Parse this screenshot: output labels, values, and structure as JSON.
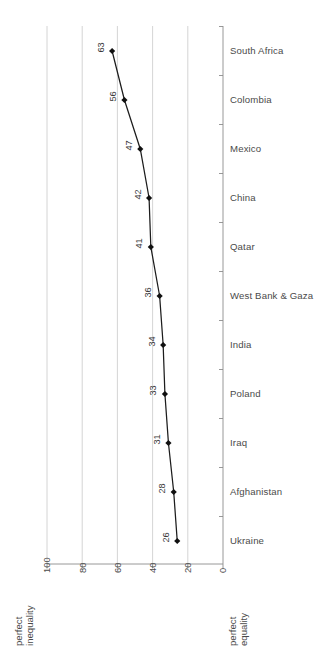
{
  "chart_data": {
    "type": "line",
    "title": "",
    "xlabel": "",
    "ylabel": "",
    "xlim": [
      100,
      0
    ],
    "ylim": null,
    "grid": true,
    "legend_position": "none",
    "orientation": "horizontal",
    "x_axis_reversed": true,
    "x_ticks": [
      "100",
      "80",
      "60",
      "40",
      "20",
      "0"
    ],
    "x_tick_values": [
      100,
      80,
      60,
      40,
      20,
      0
    ],
    "categories": [
      "South Africa",
      "Colombia",
      "Mexico",
      "China",
      "Qatar",
      "West Bank & Gaza",
      "India",
      "Poland",
      "Iraq",
      "Afghanistan",
      "Ukraine"
    ],
    "values": [
      63,
      56,
      47,
      42,
      41,
      36,
      34,
      33,
      31,
      28,
      26
    ],
    "value_labels": [
      "63",
      "56",
      "47",
      "42",
      "41",
      "36",
      "34",
      "33",
      "31",
      "28",
      "26"
    ],
    "annotations": {
      "left_axis_note": "perfect\ninequality",
      "left_axis_note_line1": "perfect",
      "left_axis_note_line2": "inequality",
      "right_axis_note_line1": "perfect",
      "right_axis_note_line2": "equality"
    },
    "colors": {
      "line": "#101010",
      "marker": "#101010",
      "gridline": "#c9c9c9",
      "axis": "#8c8c8c",
      "text": "#4a4a4a",
      "background": "#ffffff"
    }
  }
}
